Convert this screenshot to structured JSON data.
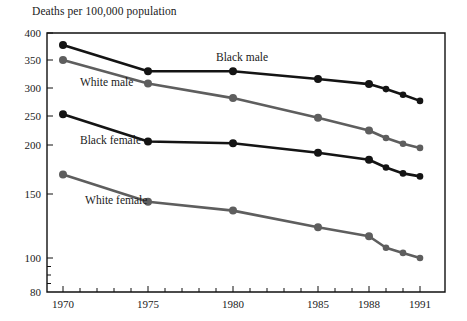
{
  "chart_data": {
    "type": "line",
    "title": "",
    "ylabel": "Deaths per 100,000 population",
    "xlabel": "",
    "x": [
      1970,
      1975,
      1980,
      1985,
      1988,
      1989,
      1990,
      1991
    ],
    "xticklabels": [
      "1970",
      "1975",
      "1980",
      "1985",
      "1988",
      "1991"
    ],
    "xtickvalues": [
      1970,
      1975,
      1980,
      1985,
      1988,
      1991
    ],
    "xlim": [
      1969,
      1992
    ],
    "yticklabels": [
      "400",
      "350",
      "300",
      "250",
      "200",
      "150",
      "100",
      "80"
    ],
    "ytickvalues": [
      400,
      350,
      300,
      250,
      200,
      150,
      100,
      80
    ],
    "yminorticks": [
      95,
      90,
      85
    ],
    "ylim": [
      80,
      400
    ],
    "yaxis_note": "nonlinear: compressed at top, expanded below 150",
    "grid": false,
    "legend_position": "inline-labels",
    "series": [
      {
        "name": "Black male",
        "color": "#141414",
        "label_text": "Black male",
        "values": [
          378,
          330,
          330,
          316,
          307,
          298,
          288,
          277
        ]
      },
      {
        "name": "White male",
        "color": "#5e5e5e",
        "label_text": "White male",
        "values": [
          350,
          308,
          282,
          247,
          225,
          212,
          202,
          197
        ]
      },
      {
        "name": "Black female",
        "color": "#141414",
        "label_text": "Black female",
        "values": [
          253,
          206,
          203,
          192,
          185,
          177,
          171,
          168
        ]
      },
      {
        "name": "White female",
        "color": "#5e5e5e",
        "label_text": "White female",
        "values": [
          170,
          144,
          137,
          124,
          117,
          108,
          104,
          100
        ]
      }
    ],
    "annotations": [
      {
        "text": "Black male",
        "x": 1979.0,
        "y": 348
      },
      {
        "text": "White male",
        "x": 1971.0,
        "y": 303
      },
      {
        "text": "Black female",
        "x": 1971.0,
        "y": 201
      },
      {
        "text": "White female",
        "x": 1971.3,
        "y": 142
      }
    ]
  }
}
